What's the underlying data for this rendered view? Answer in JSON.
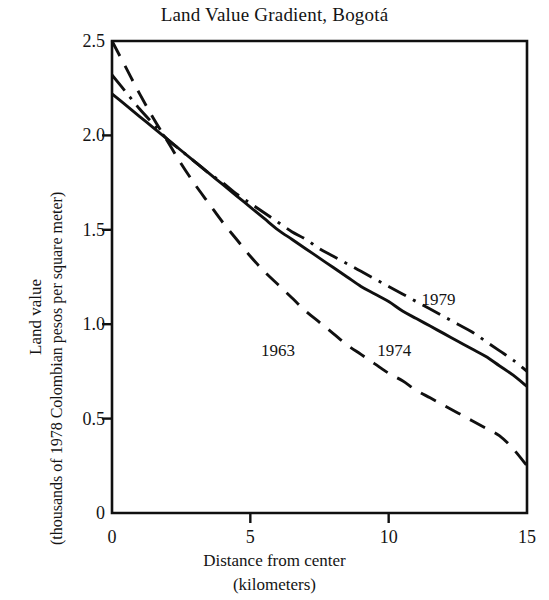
{
  "chart_data": {
    "type": "line",
    "title": "Land Value Gradient, Bogotá",
    "xlabel": "Distance from center",
    "xlabel_units": "(kilometers)",
    "ylabel": "Land value",
    "ylabel_units": "(thousands of 1978 Colombian pesos per square meter)",
    "xlim": [
      0,
      15
    ],
    "ylim": [
      0,
      2.5
    ],
    "xticks": [
      0,
      5,
      10,
      15
    ],
    "xtick_labels": [
      "0",
      "5",
      "10",
      "15"
    ],
    "yticks": [
      0,
      0.5,
      1.0,
      1.5,
      2.0,
      2.5
    ],
    "ytick_labels": [
      "0",
      "0.5",
      "1.0",
      "1.5",
      "2.0",
      "2.5"
    ],
    "grid": false,
    "legend_position": "inline-annotations",
    "line_color": "#101010",
    "x": [
      0,
      0.5,
      1,
      1.5,
      2,
      2.5,
      3,
      3.5,
      4,
      4.5,
      5,
      5.5,
      6,
      6.5,
      7,
      7.5,
      8,
      8.5,
      9,
      9.5,
      10,
      10.5,
      11,
      11.5,
      12,
      12.5,
      13,
      13.5,
      14,
      14.5,
      15
    ],
    "series": [
      {
        "name": "1963",
        "label": "1963",
        "dash_style": "dashed",
        "values": [
          2.5,
          2.36,
          2.22,
          2.09,
          1.97,
          1.85,
          1.74,
          1.64,
          1.54,
          1.45,
          1.36,
          1.28,
          1.21,
          1.14,
          1.07,
          1.01,
          0.95,
          0.89,
          0.84,
          0.79,
          0.74,
          0.7,
          0.65,
          0.61,
          0.57,
          0.53,
          0.49,
          0.45,
          0.41,
          0.34,
          0.25
        ]
      },
      {
        "name": "1974",
        "label": "1974",
        "dash_style": "solid",
        "values": [
          2.22,
          2.16,
          2.1,
          2.04,
          1.98,
          1.92,
          1.86,
          1.8,
          1.74,
          1.68,
          1.62,
          1.56,
          1.5,
          1.45,
          1.4,
          1.35,
          1.3,
          1.25,
          1.2,
          1.16,
          1.12,
          1.07,
          1.03,
          0.99,
          0.95,
          0.91,
          0.87,
          0.83,
          0.78,
          0.73,
          0.67
        ]
      },
      {
        "name": "1979",
        "label": "1979",
        "dash_style": "dash-dot",
        "values": [
          2.32,
          2.23,
          2.14,
          2.06,
          1.98,
          1.92,
          1.86,
          1.8,
          1.75,
          1.69,
          1.64,
          1.59,
          1.54,
          1.49,
          1.45,
          1.4,
          1.36,
          1.32,
          1.28,
          1.24,
          1.2,
          1.16,
          1.12,
          1.08,
          1.04,
          1.0,
          0.96,
          0.91,
          0.86,
          0.81,
          0.75
        ]
      }
    ],
    "annotations": [
      {
        "text": "1963",
        "x": 6.0,
        "y": 0.86
      },
      {
        "text": "1974",
        "x": 10.2,
        "y": 0.86
      },
      {
        "text": "1979",
        "x": 11.8,
        "y": 1.13
      }
    ]
  }
}
